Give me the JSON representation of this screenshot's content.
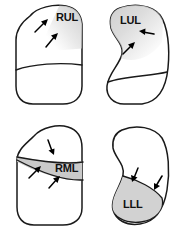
{
  "figure": {
    "background_color": "#ffffff",
    "outline_color": "#1a1a1a",
    "shade_color": "#d6d6d6",
    "label_color": "#111111"
  },
  "panels": [
    {
      "id": "panel-rul",
      "position": "top-left",
      "label": "RUL",
      "lobe_name": "right-upper-lobe",
      "arrow_count": 2,
      "shade_color": "#d6d6d6"
    },
    {
      "id": "panel-lul",
      "position": "top-right",
      "label": "LUL",
      "lobe_name": "left-upper-lobe",
      "arrow_count": 2,
      "shade_color": "#d6d6d6"
    },
    {
      "id": "panel-rml",
      "position": "bottom-left",
      "label": "RML",
      "lobe_name": "right-middle-lobe",
      "arrow_count": 3,
      "shade_color": "#c9c9c9"
    },
    {
      "id": "panel-lll",
      "position": "bottom-right",
      "label": "LLL",
      "lobe_name": "left-lower-lobe",
      "arrow_count": 2,
      "shade_color": "#d2d2d2"
    }
  ]
}
